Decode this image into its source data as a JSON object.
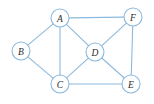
{
  "figure": {
    "width": 154,
    "height": 104,
    "background_color": "#ffffff",
    "edge_color": "#8cb9dd",
    "node_stroke_color": "#8cb9dd",
    "node_fill_color": "#ffffff",
    "label_color": "#2b2b2b",
    "node_radius": 9
  },
  "chart_data": {
    "type": "diagram",
    "diagram_kind": "undirected-graph",
    "title": "",
    "node_count": 6,
    "edge_count": 10,
    "nodes": [
      {
        "id": "A",
        "label": "A",
        "x": 60,
        "y": 18,
        "degree": 4
      },
      {
        "id": "B",
        "label": "B",
        "x": 21,
        "y": 51,
        "degree": 2
      },
      {
        "id": "C",
        "label": "C",
        "x": 60,
        "y": 84,
        "degree": 4
      },
      {
        "id": "D",
        "label": "D",
        "x": 95,
        "y": 52,
        "degree": 4
      },
      {
        "id": "E",
        "label": "E",
        "x": 131,
        "y": 84,
        "degree": 3
      },
      {
        "id": "F",
        "label": "F",
        "x": 133,
        "y": 17,
        "degree": 3
      }
    ],
    "edges": [
      {
        "id": "A-B",
        "source": "A",
        "target": "B"
      },
      {
        "id": "A-C",
        "source": "A",
        "target": "C"
      },
      {
        "id": "A-D",
        "source": "A",
        "target": "D"
      },
      {
        "id": "A-F",
        "source": "A",
        "target": "F"
      },
      {
        "id": "B-C",
        "source": "B",
        "target": "C"
      },
      {
        "id": "C-D",
        "source": "C",
        "target": "D"
      },
      {
        "id": "C-E",
        "source": "C",
        "target": "E"
      },
      {
        "id": "D-E",
        "source": "D",
        "target": "E"
      },
      {
        "id": "D-F",
        "source": "D",
        "target": "F"
      },
      {
        "id": "E-F",
        "source": "E",
        "target": "F"
      }
    ]
  }
}
